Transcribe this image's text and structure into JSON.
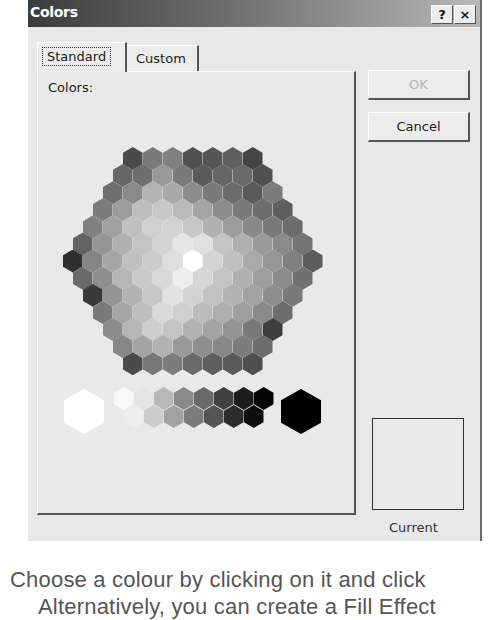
{
  "dialog": {
    "title": "Colors",
    "help_button": "?",
    "close_button": "×",
    "tabs": [
      {
        "label": "Standard",
        "active": true
      },
      {
        "label": "Custom",
        "active": false
      }
    ],
    "colors_label": "Colors:",
    "ok_label": "OK",
    "cancel_label": "Cancel",
    "new_label": "New",
    "current_label": "Current"
  },
  "honeycomb": {
    "hex_width": 20,
    "hex_height": 23,
    "row_step": 17.1,
    "center_x": 193,
    "top_y": 147,
    "rows": [
      [
        "#4a4a4a",
        "#7a7a7a",
        "#808080",
        "#505050",
        "#555555",
        "#5e5e5e",
        "#454545"
      ],
      [
        "#666666",
        "#6e6e6e",
        "#999999",
        "#7a7a7a",
        "#5a5a5a",
        "#666666",
        "#6a6a6a",
        "#505050"
      ],
      [
        "#6f6f6f",
        "#8a8a8a",
        "#b4b4b4",
        "#a8a8a8",
        "#8c8c8c",
        "#7a7a7a",
        "#6c6c6c",
        "#5a5a5a",
        "#7c7c7c"
      ],
      [
        "#7c7c7c",
        "#9c9c9c",
        "#bdbdbd",
        "#c8c8c8",
        "#bababa",
        "#a5a5a5",
        "#8c8c8c",
        "#7a7a7a",
        "#6c6c6c",
        "#5e5e5e"
      ],
      [
        "#808080",
        "#a0a0a0",
        "#c0c0c0",
        "#cfcfcf",
        "#d2d2d2",
        "#c8c8c8",
        "#b0b0b0",
        "#9c9c9c",
        "#888888",
        "#7a7a7a",
        "#6c6c6c"
      ],
      [
        "#636363",
        "#959595",
        "#b0b0b0",
        "#c4c4c4",
        "#d4d4d4",
        "#e6e6e6",
        "#e0e0e0",
        "#c4c4c4",
        "#b0b0b0",
        "#9a9a9a",
        "#8a8a8a",
        "#747474"
      ],
      [
        "#2f2f2f",
        "#858585",
        "#a6a6a6",
        "#c0c0c0",
        "#cccccc",
        "#dedede",
        "#ffffff",
        "#d4d4d4",
        "#bfbfbf",
        "#aaaaaa",
        "#969696",
        "#808080",
        "#5c5c5c"
      ],
      [
        "#6a6a6a",
        "#8e8e8e",
        "#b6b6b6",
        "#cacaca",
        "#d8d8d8",
        "#ededed",
        "#d6d6d6",
        "#c4c4c4",
        "#b0b0b0",
        "#9e9e9e",
        "#8c8c8c",
        "#707070"
      ],
      [
        "#3a3a3a",
        "#939393",
        "#b2b2b2",
        "#c6c6c6",
        "#e2e2e2",
        "#d2d2d2",
        "#c2c2c2",
        "#b2b2b2",
        "#a2a2a2",
        "#8e8e8e",
        "#7a7a7a"
      ],
      [
        "#7a7a7a",
        "#a6a6a6",
        "#bebebe",
        "#dadada",
        "#cfcfcf",
        "#bcbcbc",
        "#aeaeae",
        "#9e9e9e",
        "#8a8a8a",
        "#6e6e6e"
      ],
      [
        "#8c8c8c",
        "#b6b6b6",
        "#cecece",
        "#c4c4c4",
        "#b2b2b2",
        "#a4a4a4",
        "#949494",
        "#7a7a7a",
        "#3e3e3e"
      ],
      [
        "#868686",
        "#a4a4a4",
        "#b2b2b2",
        "#9a9a9a",
        "#8e8e8e",
        "#888888",
        "#7c7c7c",
        "#6c6c6c"
      ],
      [
        "#4a4a4a",
        "#787878",
        "#7c7c7c",
        "#6a6a6a",
        "#5e5e5e",
        "#5a5a5a",
        "#4e4e4e"
      ]
    ]
  },
  "grayscale": {
    "large_white": "#ffffff",
    "large_black": "#000000",
    "top_row": [
      "#f8f8f8",
      "#e4e4e4",
      "#b8b8b8",
      "#8a8a8a",
      "#6a6a6a",
      "#404040",
      "#1c1c1c",
      "#050505"
    ],
    "bottom_row": [
      "#eeeeee",
      "#cccccc",
      "#a2a2a2",
      "#7c7c7c",
      "#545454",
      "#2c2c2c",
      "#0e0e0e"
    ]
  },
  "caption": {
    "line1": "Choose a colour by clicking on it and click",
    "line2": "Alternatively, you can create a Fill Effect"
  }
}
